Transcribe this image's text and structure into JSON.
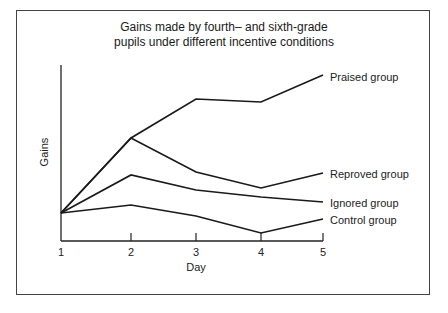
{
  "chart_data": {
    "type": "line",
    "title": "Gains made by fourth– and sixth-grade pupils under different incentive conditions",
    "title_lines": [
      "Gains made by fourth– and sixth-grade",
      "pupils under different incentive conditions"
    ],
    "xlabel": "Day",
    "ylabel": "Gains",
    "x": [
      1,
      2,
      3,
      4,
      5
    ],
    "x_tick_labels": [
      "1",
      "2",
      "3",
      "4",
      "5"
    ],
    "y_ticks": [],
    "grid": false,
    "legend_position": "inline-right",
    "series": [
      {
        "name": "Praised group",
        "values": [
          0,
          75,
          114,
          111,
          138
        ]
      },
      {
        "name": "Reproved group",
        "values": [
          0,
          75,
          41,
          25,
          40
        ]
      },
      {
        "name": "Ignored group",
        "values": [
          0,
          38,
          23,
          16,
          11
        ]
      },
      {
        "name": "Control group",
        "values": [
          0,
          8,
          -3,
          -20,
          -6
        ]
      }
    ]
  }
}
